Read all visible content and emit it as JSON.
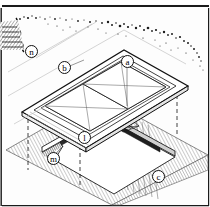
{
  "figure": {
    "kind": "technical-line-drawing",
    "background_color": "#fdfdfd",
    "line_color": "#111111",
    "top_border_color": "#1a1a1a"
  },
  "callouts": [
    {
      "id": "a",
      "label": "a",
      "x": 121,
      "y": 55,
      "target": "skylight dome right panel"
    },
    {
      "id": "b",
      "label": "b",
      "x": 58,
      "y": 61,
      "target": "skylight cap flashing / frame"
    },
    {
      "id": "c",
      "label": "c",
      "x": 152,
      "y": 170,
      "target": "corrugated roof sheeting"
    },
    {
      "id": "l",
      "label": "l",
      "x": 78,
      "y": 131,
      "target": "curb upstand at opening"
    },
    {
      "id": "m",
      "label": "m",
      "x": 47,
      "y": 152,
      "target": "side flashing / soaker"
    },
    {
      "id": "n",
      "label": "n",
      "x": 25,
      "y": 45,
      "target": "roof section cut edge"
    }
  ],
  "elements": {
    "dome_left": "pyramidal glazing panel (left)",
    "dome_right": "pyramidal glazing panel (right)",
    "frame": "rectangular skylight frame with stepped flange",
    "roof": "corrugated metal roof deck, hatched",
    "opening": "rectangular roof opening beneath the skylight",
    "projection_lines": "dashed vertical alignment lines",
    "foliage": "stippled vegetation / tree line at top right",
    "section_cut": "zig-zag break line with hatching at left"
  }
}
